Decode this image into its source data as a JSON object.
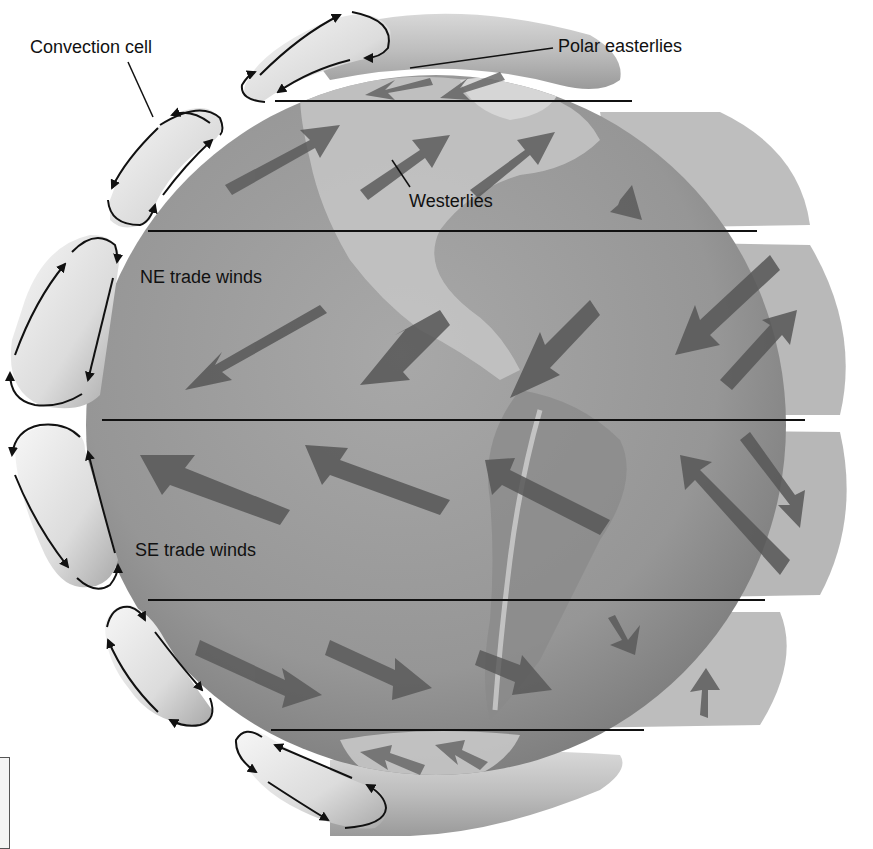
{
  "diagram": {
    "labels": {
      "convection_cell": "Convection cell",
      "polar_easterlies": "Polar easterlies",
      "westerlies": "Westerlies",
      "ne_trade_winds": "NE trade winds",
      "se_trade_winds": "SE trade winds"
    },
    "latitude_lines": [
      {
        "name": "60N",
        "y": 101,
        "x1": 275,
        "x2": 632
      },
      {
        "name": "30N",
        "y": 231,
        "x1": 148,
        "x2": 757
      },
      {
        "name": "equator",
        "y": 420,
        "x1": 102,
        "x2": 805
      },
      {
        "name": "30S",
        "y": 600,
        "x1": 148,
        "x2": 765
      },
      {
        "name": "60S",
        "y": 730,
        "x1": 271,
        "x2": 644
      }
    ],
    "wind_bands": [
      {
        "band": "polar_north",
        "direction": "east-to-west",
        "label": "Polar easterlies"
      },
      {
        "band": "mid_north",
        "direction": "west-to-east",
        "label": "Westerlies"
      },
      {
        "band": "tropic_north",
        "direction": "northeast-to-southwest",
        "label": "NE trade winds"
      },
      {
        "band": "tropic_south",
        "direction": "southeast-to-northwest",
        "label": "SE trade winds"
      },
      {
        "band": "mid_south",
        "direction": "west-to-east",
        "label": ""
      },
      {
        "band": "polar_south",
        "direction": "east-to-west",
        "label": ""
      }
    ],
    "colors": {
      "globe": "#9a9a9a",
      "globe_dark": "#7e7e7e",
      "land": "#c8c8c8",
      "arrow": "#5a5a5a",
      "cell": "#e6e6e6",
      "line": "#111111",
      "background": "#ffffff"
    }
  }
}
